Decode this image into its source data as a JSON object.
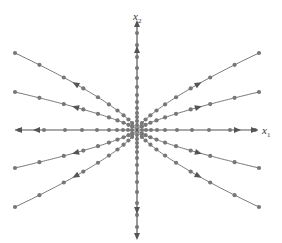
{
  "diagram": {
    "type": "phase-portrait",
    "axes": {
      "x_label": "x",
      "x_sub": "1",
      "y_label": "x",
      "y_sub": "2"
    },
    "colors": {
      "axis": "#555555",
      "curve": "#777777",
      "dot": "#777777"
    }
  }
}
